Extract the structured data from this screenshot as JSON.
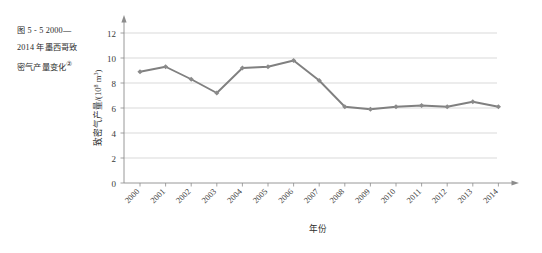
{
  "figure": {
    "caption_lines": [
      "图 5 - 5    2000—",
      "2014 年墨西哥致",
      "密气产量变化"
    ],
    "caption_footnote_marker": "②"
  },
  "chart_data": {
    "type": "line",
    "title": "",
    "xlabel": "年份",
    "ylabel": "致密气产量/(10",
    "ylabel_exponent": "8",
    "ylabel_unit_tail": " m",
    "ylabel_unit_exponent": "3",
    "ylabel_close": ")",
    "categories": [
      "2000",
      "2001",
      "2002",
      "2003",
      "2004",
      "2005",
      "2006",
      "2007",
      "2008",
      "2009",
      "2010",
      "2011",
      "2012",
      "2013",
      "2014"
    ],
    "values": [
      8.9,
      9.3,
      8.3,
      7.2,
      9.2,
      9.3,
      9.8,
      8.2,
      6.1,
      5.9,
      6.1,
      6.2,
      6.1,
      6.5,
      6.1
    ],
    "ylim": [
      0,
      12
    ],
    "yticks": [
      "0",
      "2",
      "4",
      "6",
      "8",
      "10",
      "12"
    ],
    "ytick_values": [
      0,
      2,
      4,
      6,
      8,
      10,
      12
    ],
    "grid": true,
    "legend": "none",
    "series_color": "#808080",
    "marker_color": "#8a8a8a",
    "grid_color": "#c9c9c9",
    "axis_color": "#8c8c8c"
  }
}
